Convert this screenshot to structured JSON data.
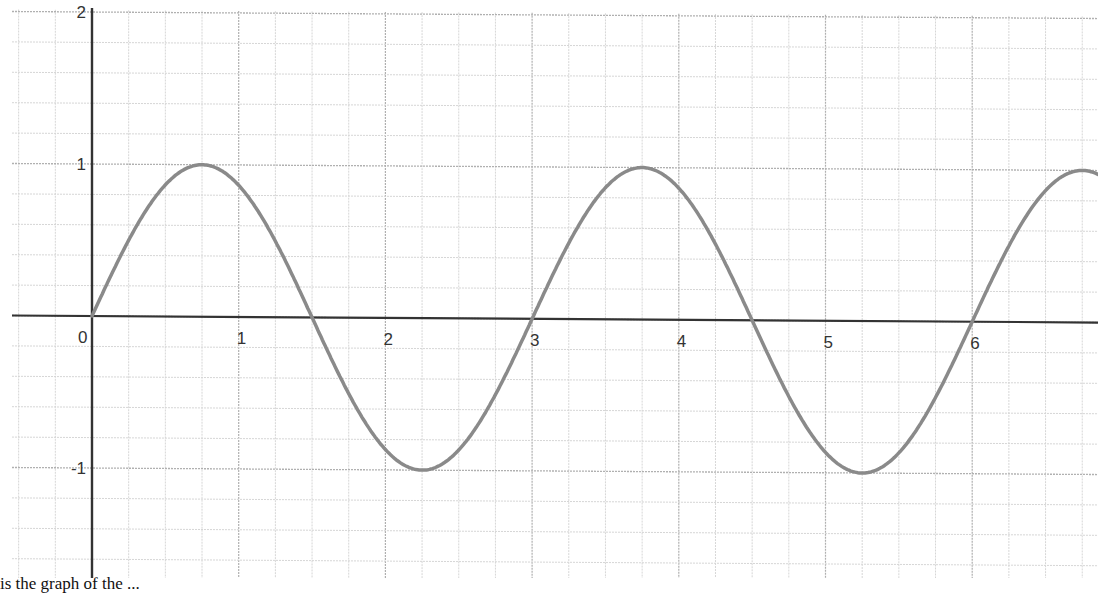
{
  "chart_data": {
    "type": "line",
    "title": "",
    "xlabel": "",
    "ylabel": "",
    "function": "y = sin(2πx/3)",
    "xlim": [
      -0.63,
      6.85
    ],
    "ylim": [
      -1.75,
      2.0
    ],
    "grid": true,
    "minor_grid": {
      "x_step": 0.25,
      "y_step": 0.2
    },
    "x_ticks": [
      0,
      1,
      2,
      3,
      4,
      5,
      6
    ],
    "x_tick_labels": [
      "0",
      "1",
      "2",
      "3",
      "4",
      "5",
      "6"
    ],
    "y_ticks": [
      2,
      1,
      -1
    ],
    "y_tick_labels": [
      "2",
      "1",
      "-1"
    ],
    "series": [
      {
        "name": "curve",
        "x": [
          0,
          0.375,
          0.75,
          1.125,
          1.5,
          1.875,
          2.25,
          2.625,
          3,
          3.375,
          3.75,
          4.125,
          4.5,
          4.875,
          5.25,
          5.625,
          6,
          6.375,
          6.75
        ],
        "y": [
          0,
          0.71,
          1,
          0.71,
          0,
          -0.71,
          -1,
          -0.71,
          0,
          0.71,
          1,
          0.71,
          0,
          -0.71,
          -1,
          -0.71,
          0,
          0.71,
          1
        ],
        "color": "#8a8a8a"
      }
    ],
    "key_points": {
      "zeros": [
        0,
        1.5,
        3,
        4.5,
        6
      ],
      "maxima": [
        0.75,
        3.75,
        6.75
      ],
      "minima": [
        2.25,
        5.25
      ]
    }
  },
  "colors": {
    "axis": "#333333",
    "major_grid": "#b0b0b0",
    "minor_grid": "#d6d6d6",
    "curve": "#8a8a8a",
    "label": "#333333"
  },
  "caption": "is the graph of the ..."
}
